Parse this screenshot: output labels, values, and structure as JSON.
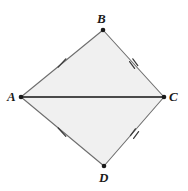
{
  "figure": {
    "type": "geometry-diagram",
    "shape_name": "kite",
    "canvas": {
      "width": 188,
      "height": 191
    },
    "background_color": "#ffffff",
    "fill_color": "#f0f0f0",
    "stroke_color": "#6e6e6e",
    "diagonal_color": "#4a4a4a",
    "vertex_dot_color": "#1a1a1a",
    "tick_color": "#4a4a4a",
    "vertices": [
      {
        "id": "A",
        "label": "A",
        "x": 21,
        "y": 97,
        "label_x": 7,
        "label_y": 90
      },
      {
        "id": "B",
        "label": "B",
        "x": 103,
        "y": 30,
        "label_x": 97,
        "label_y": 12
      },
      {
        "id": "C",
        "label": "C",
        "x": 164,
        "y": 97,
        "label_x": 169,
        "label_y": 90
      },
      {
        "id": "D",
        "label": "D",
        "x": 104,
        "y": 166,
        "label_x": 99,
        "label_y": 171
      }
    ],
    "outline_path": "M 21 97 L 103 30 L 164 97 L 104 166 Z",
    "diagonal": {
      "from": "A",
      "to": "C",
      "x1": 21,
      "y1": 97,
      "x2": 164,
      "y2": 97
    },
    "sides": [
      {
        "name": "AB",
        "from": "A",
        "to": "B",
        "ticks": 1,
        "tick_x": 62,
        "tick_y": 63
      },
      {
        "name": "BC",
        "from": "B",
        "to": "C",
        "ticks": 2,
        "tick_x": 133,
        "tick_y": 63
      },
      {
        "name": "AD",
        "from": "A",
        "to": "D",
        "ticks": 1,
        "tick_x": 62,
        "tick_y": 132
      },
      {
        "name": "DC",
        "from": "D",
        "to": "C",
        "ticks": 2,
        "tick_x": 134,
        "tick_y": 132
      }
    ],
    "congruence_note": "AB congruent to AD (single tick); BC congruent to DC (double tick)"
  }
}
